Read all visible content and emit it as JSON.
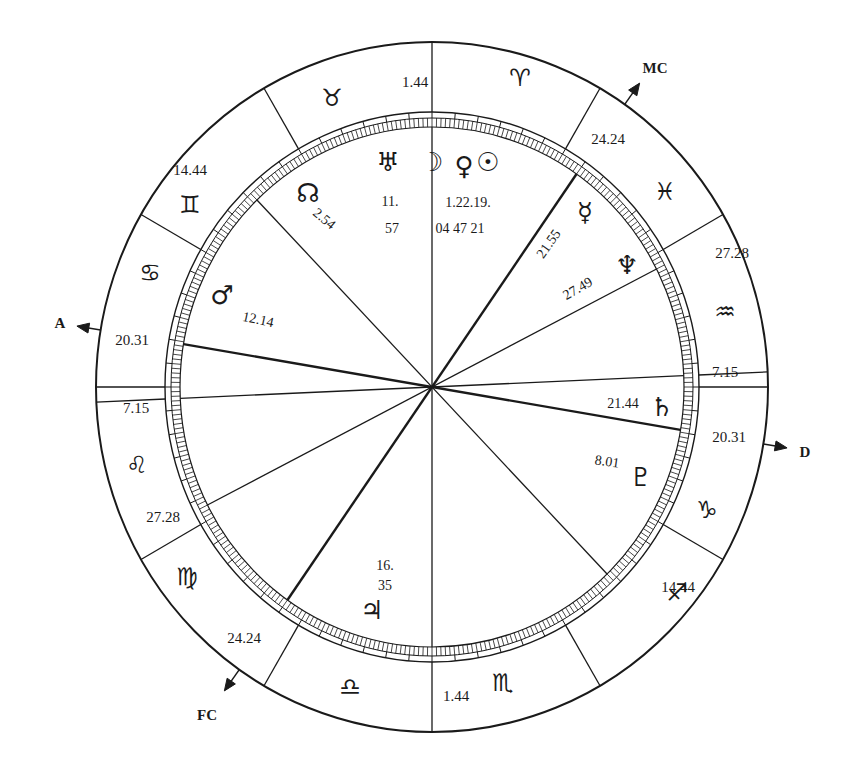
{
  "chart": {
    "center": [
      432,
      387
    ],
    "colors": {
      "ink": "#1a1a1a",
      "background": "#ffffff"
    },
    "axes": [
      {
        "id": "asc",
        "label": "A",
        "x": 60,
        "y": 323
      },
      {
        "id": "mc",
        "label": "MC",
        "x": 655,
        "y": 68
      },
      {
        "id": "desc",
        "label": "D",
        "x": 805,
        "y": 452
      },
      {
        "id": "fc",
        "label": "FC",
        "x": 207,
        "y": 715
      }
    ],
    "signs": [
      {
        "name": "Aries",
        "glyph": "♈",
        "x": 520,
        "y": 78
      },
      {
        "name": "Taurus",
        "glyph": "♉",
        "x": 332,
        "y": 98
      },
      {
        "name": "Gemini",
        "glyph": "♊",
        "x": 190,
        "y": 205
      },
      {
        "name": "Cancer",
        "glyph": "♋",
        "x": 150,
        "y": 273
      },
      {
        "name": "Leo",
        "glyph": "♌",
        "x": 137,
        "y": 465
      },
      {
        "name": "Virgo",
        "glyph": "♍",
        "x": 187,
        "y": 577
      },
      {
        "name": "Libra",
        "glyph": "♎",
        "x": 350,
        "y": 687
      },
      {
        "name": "Scorpio",
        "glyph": "♏",
        "x": 503,
        "y": 683
      },
      {
        "name": "Sagittarius",
        "glyph": "♐",
        "x": 677,
        "y": 593
      },
      {
        "name": "Capricorn",
        "glyph": "♑",
        "x": 707,
        "y": 510
      },
      {
        "name": "Aquarius",
        "glyph": "♒",
        "x": 725,
        "y": 312
      },
      {
        "name": "Pisces",
        "glyph": "♓",
        "x": 665,
        "y": 192
      }
    ],
    "house_cusp_degrees": [
      {
        "value": "1.44",
        "x": 415,
        "y": 82
      },
      {
        "value": "24.24",
        "x": 608,
        "y": 139
      },
      {
        "value": "27.28",
        "x": 732,
        "y": 253
      },
      {
        "value": "7.15",
        "x": 725,
        "y": 372
      },
      {
        "value": "20.31",
        "x": 729,
        "y": 437
      },
      {
        "value": "14.44",
        "x": 678,
        "y": 587
      },
      {
        "value": "1.44",
        "x": 456,
        "y": 696
      },
      {
        "value": "24.24",
        "x": 244,
        "y": 638
      },
      {
        "value": "27.28",
        "x": 163,
        "y": 517
      },
      {
        "value": "7.15",
        "x": 136,
        "y": 408
      },
      {
        "value": "20.31",
        "x": 132,
        "y": 340
      },
      {
        "value": "14.44",
        "x": 190,
        "y": 170
      }
    ],
    "planets": [
      {
        "name": "Uranus",
        "glyph": "♅",
        "x": 388,
        "y": 162,
        "deg": "11.",
        "min": "57",
        "deg_x": 390,
        "deg_y": 202,
        "min_x": 392,
        "min_y": 229
      },
      {
        "name": "Moon",
        "glyph": "☽",
        "x": 432,
        "y": 162
      },
      {
        "name": "Venus",
        "glyph": "♀",
        "x": 464,
        "y": 166
      },
      {
        "name": "Sun",
        "glyph": "☉",
        "x": 488,
        "y": 162
      },
      {
        "name": "Moon-Venus-Sun degrees",
        "deg": "1.22.19.",
        "min": "04 47 21",
        "deg_x": 468,
        "deg_y": 203,
        "min_x": 460,
        "min_y": 229
      },
      {
        "name": "North Node",
        "glyph": "☊",
        "x": 308,
        "y": 193,
        "deg": "2.54",
        "deg_x": 324,
        "deg_y": 219,
        "rot": 40
      },
      {
        "name": "Mercury",
        "glyph": "☿",
        "x": 585,
        "y": 212,
        "deg": "21.55",
        "deg_x": 549,
        "deg_y": 244,
        "rot": -55
      },
      {
        "name": "Neptune",
        "glyph": "♆",
        "x": 627,
        "y": 265,
        "deg": "27.49",
        "deg_x": 578,
        "deg_y": 289,
        "rot": -30
      },
      {
        "name": "Mars",
        "glyph": "♂",
        "x": 222,
        "y": 295,
        "deg": "12.14",
        "deg_x": 258,
        "deg_y": 320,
        "rot": 12
      },
      {
        "name": "Saturn",
        "glyph": "♄",
        "x": 662,
        "y": 407,
        "deg": "21.44",
        "deg_x": 623,
        "deg_y": 404,
        "rot": 0
      },
      {
        "name": "Pluto",
        "glyph": "♇",
        "x": 641,
        "y": 477,
        "deg": "8.01",
        "deg_x": 607,
        "deg_y": 462,
        "rot": 8
      },
      {
        "name": "Jupiter",
        "glyph": "♃",
        "x": 372,
        "y": 610,
        "deg": "16.",
        "min": "35",
        "deg_x": 385,
        "deg_y": 566,
        "min_x": 385,
        "min_y": 586
      }
    ]
  }
}
